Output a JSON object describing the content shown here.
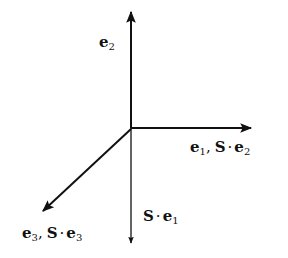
{
  "diagram": {
    "title": "",
    "vectors": [
      {
        "id": "e2",
        "direction": "up",
        "label": {
          "base": "e",
          "sub": "2",
          "suffix": null
        }
      },
      {
        "id": "e1",
        "direction": "right",
        "label": {
          "base": "e",
          "sub": "1",
          "suffix": {
            "op": "S",
            "dot": "·",
            "base": "e",
            "sub": "2"
          }
        }
      },
      {
        "id": "se1",
        "direction": "down",
        "label": {
          "prefix": {
            "op": "S",
            "dot": "·"
          },
          "base": "e",
          "sub": "1"
        }
      },
      {
        "id": "e3",
        "direction": "down-left",
        "label": {
          "base": "e",
          "sub": "3",
          "suffix": {
            "op": "S",
            "dot": "·",
            "base": "e",
            "sub": "3"
          }
        }
      }
    ],
    "labels": {
      "e2": {
        "e": "e",
        "sub": "2"
      },
      "e1": {
        "e": "e",
        "sub": "1",
        "comma": ",",
        "S": "S",
        "dot": "·",
        "e2": "e",
        "sub2": "2"
      },
      "se1": {
        "S": "S",
        "dot": "·",
        "e": "e",
        "sub": "1"
      },
      "e3": {
        "e": "e",
        "sub": "3",
        "comma": ",",
        "S": "S",
        "dot": "·",
        "e2": "e",
        "sub2": "3"
      }
    },
    "colors": {
      "stroke": "#111111",
      "background": "#ffffff"
    }
  }
}
